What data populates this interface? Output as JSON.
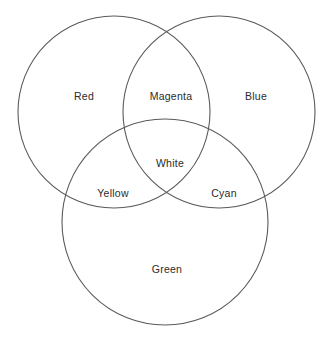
{
  "diagram": {
    "type": "venn-3-set",
    "title": "",
    "background_color": "#ffffff",
    "stroke_color": "#5a5a5a",
    "text_color": "#2b2b2b",
    "sets": [
      {
        "key": "red",
        "label": "Red",
        "label_x": 84,
        "label_y": 96,
        "circle": {
          "cx": 114,
          "cy": 112,
          "r": 96
        }
      },
      {
        "key": "blue",
        "label": "Blue",
        "label_x": 256,
        "label_y": 96,
        "circle": {
          "cx": 219,
          "cy": 112,
          "r": 96
        }
      },
      {
        "key": "green",
        "label": "Green",
        "label_x": 167,
        "label_y": 269,
        "circle": {
          "cx": 165,
          "cy": 222,
          "r": 103
        }
      }
    ],
    "intersections": [
      {
        "key": "magenta",
        "label": "Magenta",
        "of": "Red + Blue",
        "label_x": 171,
        "label_y": 96
      },
      {
        "key": "yellow",
        "label": "Yellow",
        "of": "Red + Green",
        "label_x": 113,
        "label_y": 193
      },
      {
        "key": "cyan",
        "label": "Cyan",
        "of": "Blue + Green",
        "label_x": 224,
        "label_y": 193
      },
      {
        "key": "white",
        "label": "White",
        "of": "Red + Blue + Green",
        "label_x": 170,
        "label_y": 163
      }
    ]
  }
}
